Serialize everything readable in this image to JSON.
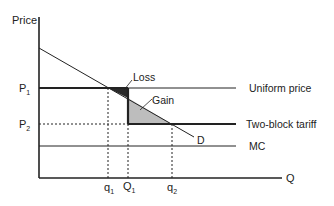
{
  "axes": {
    "y_label": "Price",
    "x_label": "Q"
  },
  "price_levels": {
    "p1": {
      "main": "P",
      "sub": "1"
    },
    "p2": {
      "main": "P",
      "sub": "2"
    }
  },
  "quantity_levels": {
    "q1": {
      "main": "q",
      "sub": "1"
    },
    "Q1": {
      "main": "Q",
      "sub": "1"
    },
    "q2": {
      "main": "q",
      "sub": "2"
    }
  },
  "line_labels": {
    "uniform": "Uniform price",
    "two_block": "Two-block tariff",
    "mc": "MC",
    "demand": "D"
  },
  "area_labels": {
    "loss": "Loss",
    "gain": "Gain"
  },
  "colors": {
    "line": "#222222",
    "loss_fill": "#2a2a2a",
    "gain_fill": "#bdbdbd"
  }
}
